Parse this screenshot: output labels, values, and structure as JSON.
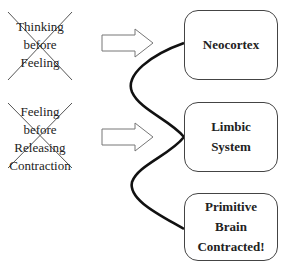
{
  "left_labels": [
    {
      "lines": [
        "Thinking",
        "before",
        "Feeling"
      ],
      "crossed_out": true
    },
    {
      "lines": [
        "Feeling",
        "before",
        "Releasing",
        "Contraction"
      ],
      "crossed_out": true
    }
  ],
  "boxes": [
    {
      "lines": [
        "Neocortex"
      ]
    },
    {
      "lines": [
        "Limbic",
        "System"
      ]
    },
    {
      "lines": [
        "Primitive",
        "Brain",
        "Contracted!"
      ]
    }
  ],
  "colors": {
    "stroke": "#111111",
    "box_border": "#444444",
    "text": "#222222"
  }
}
